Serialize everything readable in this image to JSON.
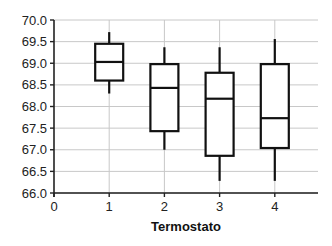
{
  "chart_data": {
    "type": "boxplot",
    "title": "",
    "xlabel": "Termostato",
    "ylabel": "",
    "xlim": [
      0,
      4.8
    ],
    "ylim": [
      66.0,
      70.0
    ],
    "x_ticks": [
      "0",
      "1",
      "2",
      "3",
      "4"
    ],
    "y_ticks": [
      "66.0",
      "66.5",
      "67.0",
      "67.5",
      "68.0",
      "68.5",
      "69.0",
      "69.5",
      "70.0"
    ],
    "grid": true,
    "legend": null,
    "categories": [
      "1",
      "2",
      "3",
      "4"
    ],
    "series": [
      {
        "name": "1",
        "x": 1,
        "whisker_low": 68.3,
        "q1": 68.6,
        "median": 69.03,
        "q3": 69.45,
        "whisker_high": 69.72
      },
      {
        "name": "2",
        "x": 2,
        "whisker_low": 67.0,
        "q1": 67.43,
        "median": 68.43,
        "q3": 68.98,
        "whisker_high": 69.37
      },
      {
        "name": "3",
        "x": 3,
        "whisker_low": 66.28,
        "q1": 66.86,
        "median": 68.18,
        "q3": 68.78,
        "whisker_high": 69.37
      },
      {
        "name": "4",
        "x": 4,
        "whisker_low": 66.28,
        "q1": 67.04,
        "median": 67.73,
        "q3": 68.98,
        "whisker_high": 69.56
      }
    ],
    "colors": {
      "box": "#111111",
      "grid": "#c8c8c8",
      "axis": "#222222"
    }
  }
}
